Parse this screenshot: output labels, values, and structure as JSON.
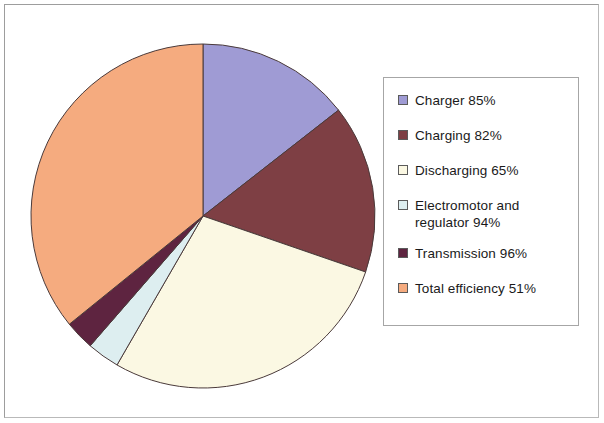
{
  "chart_data": {
    "type": "pie",
    "title": "",
    "categories": [
      "Charger 85%",
      "Charging 82%",
      "Discharging 65%",
      "Electromotor and regulator 94%",
      "Transmission 96%",
      "Total efficiency 51%"
    ],
    "labels": [
      "Charger",
      "Charging",
      "Discharging",
      "Electromotor and regulator",
      "Transmission",
      "Total efficiency"
    ],
    "values": [
      85,
      82,
      65,
      94,
      96,
      51
    ],
    "value_suffix": "%",
    "slice_angles_deg": [
      52,
      57,
      101,
      11,
      10,
      129
    ],
    "start_angle_deg": 0,
    "direction": "clockwise",
    "colors": [
      "#9f9bd4",
      "#7e3f44",
      "#fbf8e3",
      "#ddeef0",
      "#5e2440",
      "#f5ab7f"
    ],
    "legend_position": "right",
    "grid": false,
    "xlabel": "",
    "ylabel": ""
  },
  "legend": {
    "items": [
      {
        "label": "Charger 85%",
        "color": "#9f9bd4",
        "swatch": "legend-swatch-charger"
      },
      {
        "label": "Charging 82%",
        "color": "#7e3f44",
        "swatch": "legend-swatch-charging"
      },
      {
        "label": "Discharging 65%",
        "color": "#fbf8e3",
        "swatch": "legend-swatch-discharging"
      },
      {
        "label": "Electromotor and\nregulator 94%",
        "color": "#ddeef0",
        "swatch": "legend-swatch-electromotor"
      },
      {
        "label": "Transmission 96%",
        "color": "#5e2440",
        "swatch": "legend-swatch-transmission"
      },
      {
        "label": "Total efficiency 51%",
        "color": "#f5ab7f",
        "swatch": "legend-swatch-total-efficiency"
      }
    ]
  },
  "style": {
    "slice_outline": "#4a3a3a",
    "frame_border": "#b9b9b9",
    "legend_border": "#a6a6a6",
    "background": "#ffffff",
    "text_color": "#1a1a1a"
  }
}
